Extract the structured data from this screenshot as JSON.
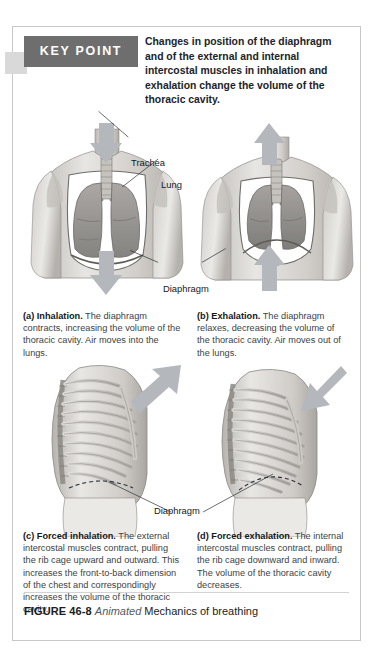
{
  "keypoint": {
    "banner_label": "KEY POINT",
    "text": "Changes in position of the diaphragm and of the external and internal intercostal muscles in inhalation and exhalation change the volume of the thoracic cavity."
  },
  "labels": {
    "trachea": "Trachea",
    "lung": "Lung",
    "diaphragm_top": "Diaphragm",
    "diaphragm_bottom": "Diaphragm"
  },
  "panels": [
    {
      "id": "a",
      "marker": "(a) Inhalation.",
      "body": " The diaphragm contracts, increasing the volume of the thoracic cavity. Air moves into the lungs.",
      "view": "anterior torso with lungs and trachea",
      "arrow_direction": "down"
    },
    {
      "id": "b",
      "marker": "(b) Exhalation.",
      "body": " The diaphragm relaxes, decreasing the volume of the thoracic cavity. Air moves out of the lungs.",
      "view": "anterior torso with lungs and trachea",
      "arrow_direction": "up"
    },
    {
      "id": "c",
      "marker": "(c) Forced inhalation.",
      "body": " The external intercostal muscles contract, pulling the rib cage upward and outward. This increases the front-to-back dimension of the chest and correspondingly increases the volume of the thoracic cavity.",
      "view": "lateral rib cage",
      "arrow_direction": "up-and-out"
    },
    {
      "id": "d",
      "marker": "(d) Forced exhalation.",
      "body": " The internal intercostal muscles contract, pulling the rib cage downward and inward. The volume of the thoracic cavity decreases.",
      "view": "lateral rib cage",
      "arrow_direction": "down-and-in"
    }
  ],
  "footer": {
    "figure_number": "FIGURE 46-8",
    "animated_tag": "Animated",
    "title": "Mechanics of breathing"
  },
  "colors": {
    "banner_background": "#6e6e6e",
    "banner_text": "#ffffff",
    "tab": "#d9d9d9",
    "frame_border": "#c8c8c8",
    "arrow_fill": "#b4b7bb",
    "body_text": "#3b3f45",
    "heading_text": "#15181c",
    "skin_light": "#e6e4e1",
    "skin_mid": "#c9c6c2",
    "skin_dark": "#a7a4a0",
    "lung_fill": "#9d9a97",
    "bone_fill": "#d7d5d2"
  }
}
